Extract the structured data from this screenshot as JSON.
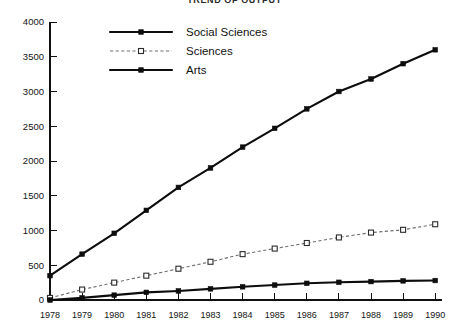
{
  "title": "TREND OF OUTPUT",
  "chart_data": {
    "type": "line",
    "title": "TREND OF OUTPUT",
    "xlabel": "",
    "ylabel": "",
    "x": [
      1978,
      1979,
      1980,
      1981,
      1982,
      1983,
      1984,
      1985,
      1986,
      1987,
      1988,
      1989,
      1990
    ],
    "xtick_labels": [
      "1978",
      "1979",
      "1980",
      "1981",
      "1982",
      "1983",
      "1984",
      "1985",
      "1986",
      "1987",
      "1988",
      "1989",
      "1990"
    ],
    "ytick_labels": [
      "0",
      "500",
      "1000",
      "1500",
      "2000",
      "2500",
      "3000",
      "3500",
      "4000"
    ],
    "yticks": [
      0,
      500,
      1000,
      1500,
      2000,
      2500,
      3000,
      3500,
      4000
    ],
    "ylim": [
      0,
      4000
    ],
    "xlim": [
      1978,
      1990
    ],
    "grid": false,
    "legend_position": "top-center",
    "series": [
      {
        "name": "Social Sciences",
        "marker": "filled-square",
        "line_style": "solid-thick",
        "color": "#0d0d0d",
        "values": [
          350,
          660,
          960,
          1290,
          1620,
          1900,
          2200,
          2470,
          2750,
          3000,
          3180,
          3400,
          3600
        ]
      },
      {
        "name": "Sciences",
        "marker": "open-square",
        "line_style": "dotted-thin",
        "color": "#6e6e6e",
        "values": [
          30,
          150,
          250,
          350,
          450,
          550,
          660,
          740,
          820,
          900,
          970,
          1010,
          1090
        ]
      },
      {
        "name": "Arts",
        "marker": "filled-square",
        "line_style": "solid-thick",
        "color": "#0d0d0d",
        "values": [
          0,
          30,
          70,
          110,
          130,
          160,
          190,
          215,
          240,
          255,
          265,
          275,
          280
        ]
      }
    ]
  },
  "legend": {
    "items": [
      {
        "label": "Social Sciences"
      },
      {
        "label": "Sciences"
      },
      {
        "label": "Arts"
      }
    ]
  }
}
